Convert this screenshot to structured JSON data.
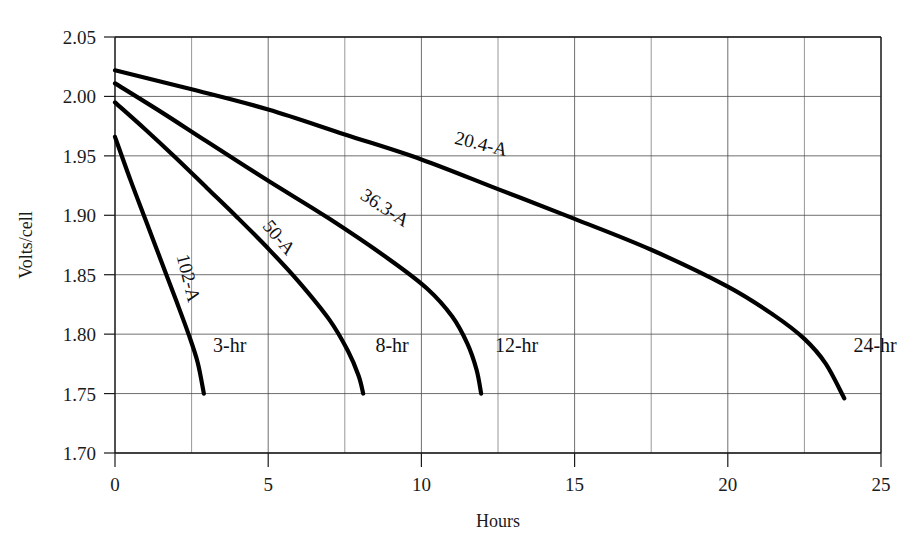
{
  "chart_data": {
    "type": "line",
    "title": "",
    "subtitle": "",
    "xlabel": "Hours",
    "ylabel": "Volts/cell",
    "xlim": [
      0,
      25
    ],
    "ylim": [
      1.7,
      2.05
    ],
    "x_ticks": [
      0,
      5,
      10,
      15,
      20,
      25
    ],
    "x_tick_labels": [
      "0",
      "5",
      "10",
      "15",
      "20",
      "25"
    ],
    "x_minor_gridlines": [
      2.5,
      7.5,
      12.5,
      17.5,
      22.5
    ],
    "y_ticks": [
      1.7,
      1.75,
      1.8,
      1.85,
      1.9,
      1.95,
      2.0,
      2.05
    ],
    "y_tick_labels": [
      "1.70",
      "1.75",
      "1.80",
      "1.85",
      "1.90",
      "1.95",
      "2.00",
      "2.05"
    ],
    "grid": true,
    "legend_position": "inline-labels",
    "series": [
      {
        "name": "20.4-A",
        "rate_label": "20.4-A",
        "duration_label": "24-hr",
        "current_amps": 20.4,
        "points": [
          {
            "x": 0.0,
            "y": 2.022
          },
          {
            "x": 2.5,
            "y": 2.006
          },
          {
            "x": 5.0,
            "y": 1.989
          },
          {
            "x": 7.5,
            "y": 1.968
          },
          {
            "x": 10.0,
            "y": 1.947
          },
          {
            "x": 12.5,
            "y": 1.922
          },
          {
            "x": 15.0,
            "y": 1.897
          },
          {
            "x": 17.5,
            "y": 1.871
          },
          {
            "x": 20.0,
            "y": 1.84
          },
          {
            "x": 21.5,
            "y": 1.816
          },
          {
            "x": 22.5,
            "y": 1.796
          },
          {
            "x": 23.2,
            "y": 1.775
          },
          {
            "x": 23.8,
            "y": 1.746
          }
        ]
      },
      {
        "name": "36.3-A",
        "rate_label": "36.3-A",
        "duration_label": "12-hr",
        "current_amps": 36.3,
        "points": [
          {
            "x": 0.0,
            "y": 2.011
          },
          {
            "x": 1.5,
            "y": 1.987
          },
          {
            "x": 3.0,
            "y": 1.962
          },
          {
            "x": 5.0,
            "y": 1.929
          },
          {
            "x": 7.0,
            "y": 1.897
          },
          {
            "x": 9.0,
            "y": 1.862
          },
          {
            "x": 10.2,
            "y": 1.838
          },
          {
            "x": 11.0,
            "y": 1.815
          },
          {
            "x": 11.5,
            "y": 1.792
          },
          {
            "x": 11.8,
            "y": 1.77
          },
          {
            "x": 11.95,
            "y": 1.75
          }
        ]
      },
      {
        "name": "50-A",
        "rate_label": "50-A",
        "duration_label": "8-hr",
        "current_amps": 50,
        "points": [
          {
            "x": 0.0,
            "y": 1.995
          },
          {
            "x": 1.0,
            "y": 1.972
          },
          {
            "x": 2.0,
            "y": 1.948
          },
          {
            "x": 3.0,
            "y": 1.923
          },
          {
            "x": 4.0,
            "y": 1.898
          },
          {
            "x": 5.0,
            "y": 1.872
          },
          {
            "x": 6.0,
            "y": 1.844
          },
          {
            "x": 7.0,
            "y": 1.812
          },
          {
            "x": 7.6,
            "y": 1.786
          },
          {
            "x": 7.95,
            "y": 1.765
          },
          {
            "x": 8.1,
            "y": 1.75
          }
        ]
      },
      {
        "name": "102-A",
        "rate_label": "102-A",
        "duration_label": "3-hr",
        "current_amps": 102,
        "points": [
          {
            "x": 0.0,
            "y": 1.966
          },
          {
            "x": 0.5,
            "y": 1.93
          },
          {
            "x": 1.0,
            "y": 1.896
          },
          {
            "x": 1.5,
            "y": 1.862
          },
          {
            "x": 2.0,
            "y": 1.828
          },
          {
            "x": 2.4,
            "y": 1.8
          },
          {
            "x": 2.7,
            "y": 1.776
          },
          {
            "x": 2.9,
            "y": 1.75
          }
        ]
      }
    ],
    "inline_rate_labels": [
      {
        "text": "20.4-A",
        "x": 11.9,
        "y": 1.955,
        "rotation": 14
      },
      {
        "text": "36.3-A",
        "x": 8.7,
        "y": 1.902,
        "rotation": 33
      },
      {
        "text": "50-A",
        "x": 5.2,
        "y": 1.878,
        "rotation": 50
      },
      {
        "text": "102-A",
        "x": 2.2,
        "y": 1.846,
        "rotation": 76
      }
    ],
    "inline_duration_labels": [
      {
        "text": "3-hr",
        "x": 3.2,
        "y": 1.785
      },
      {
        "text": "8-hr",
        "x": 8.5,
        "y": 1.785
      },
      {
        "text": "12-hr",
        "x": 12.4,
        "y": 1.785
      },
      {
        "text": "24-hr",
        "x": 24.1,
        "y": 1.785
      }
    ]
  },
  "colors": {
    "curve": "#000000",
    "grid": "#4a4a4a",
    "axis": "#1a1a1a",
    "text": "#1b1b1b",
    "background": "#ffffff"
  }
}
